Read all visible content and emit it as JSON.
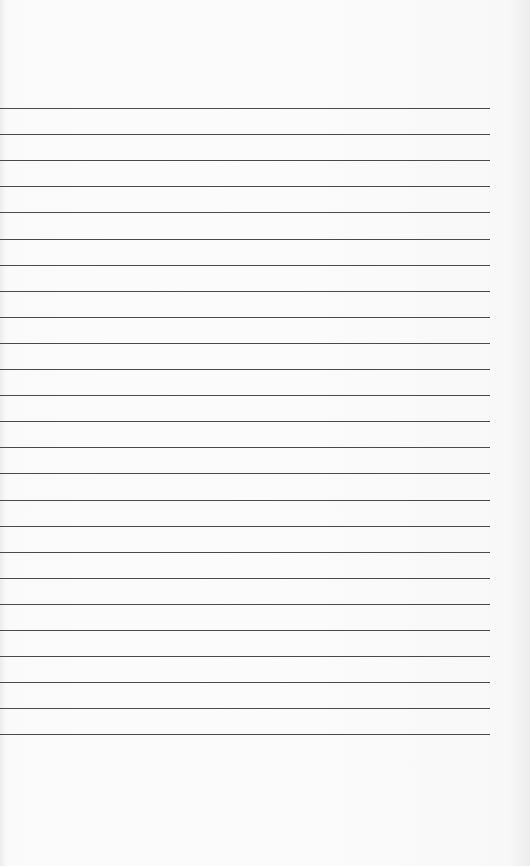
{
  "page": {
    "type": "lined-paper",
    "background_color": "#f9f9f9",
    "line_color": "#4a4a4a",
    "line_count": 25,
    "first_line_y": 108,
    "line_spacing": 26.1,
    "line_width": 490
  }
}
